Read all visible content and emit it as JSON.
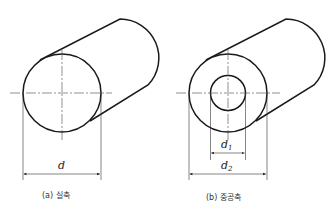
{
  "figures": [
    {
      "id": "a",
      "type": "solid-shaft",
      "caption": "(a) 실축",
      "dimensions": [
        {
          "label": "d",
          "subscript": ""
        }
      ]
    },
    {
      "id": "b",
      "type": "hollow-shaft",
      "caption": "(b) 중공축",
      "dimensions": [
        {
          "label": "d",
          "subscript": "1"
        },
        {
          "label": "d",
          "subscript": "2"
        }
      ]
    }
  ],
  "colors": {
    "line": "#1a1a1a",
    "hatch": "#555555",
    "background": "#ffffff"
  }
}
